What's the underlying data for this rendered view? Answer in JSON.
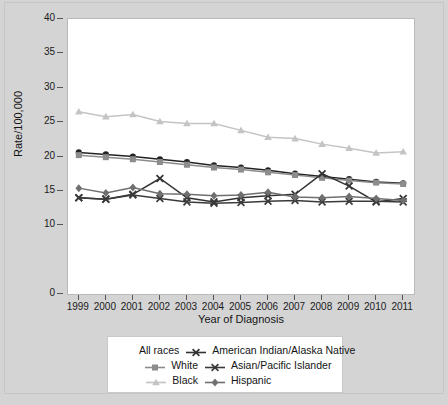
{
  "chart_data": {
    "type": "line",
    "title": "",
    "xlabel": "Year of Diagnosis",
    "ylabel": "Rate/100,000",
    "x": [
      1999,
      2000,
      2001,
      2002,
      2003,
      2004,
      2005,
      2006,
      2007,
      2008,
      2009,
      2010,
      2011
    ],
    "categories": [
      "1999",
      "2000",
      "2001",
      "2002",
      "2003",
      "2004",
      "2005",
      "2006",
      "2007",
      "2008",
      "2009",
      "2010",
      "2011"
    ],
    "xlim": [
      1998.6,
      2011.4
    ],
    "ylim": [
      0,
      40
    ],
    "y_ticks": [
      0,
      10,
      15,
      20,
      25,
      30,
      35,
      40
    ],
    "y_tick_labels": [
      "0",
      "10",
      "15",
      "20",
      "25",
      "30",
      "35",
      "40"
    ],
    "grid": false,
    "legend_position": "bottom",
    "series": [
      {
        "name": "All races",
        "marker": "circle",
        "color": "#232323",
        "values": [
          20.6,
          20.3,
          20.0,
          19.6,
          19.2,
          18.7,
          18.4,
          18.0,
          17.5,
          17.1,
          16.7,
          16.3,
          16.1
        ]
      },
      {
        "name": "White",
        "marker": "square",
        "color": "#8c8c8c",
        "values": [
          20.2,
          19.9,
          19.6,
          19.2,
          18.8,
          18.4,
          18.1,
          17.7,
          17.3,
          16.9,
          16.5,
          16.2,
          16.0
        ]
      },
      {
        "name": "Black",
        "marker": "triangle",
        "color": "#c4c4c4",
        "values": [
          26.5,
          25.8,
          26.1,
          25.1,
          24.8,
          24.8,
          23.8,
          22.8,
          22.6,
          21.8,
          21.2,
          20.5,
          20.7
        ]
      },
      {
        "name": "American Indian/Alaska Native",
        "marker": "cross",
        "color": "#333333",
        "values": [
          14.0,
          13.8,
          14.5,
          16.8,
          14.0,
          13.4,
          14.0,
          14.3,
          14.5,
          17.5,
          15.7,
          13.4,
          13.9
        ]
      },
      {
        "name": "Asian/Pacific Islander",
        "marker": "cross",
        "color": "#3a3a3a",
        "values": [
          14.0,
          13.8,
          14.4,
          13.9,
          13.4,
          13.2,
          13.3,
          13.5,
          13.6,
          13.4,
          13.5,
          13.5,
          13.4
        ]
      },
      {
        "name": "Hispanic",
        "marker": "diamond",
        "color": "#6f6f6f",
        "values": [
          15.4,
          14.7,
          15.5,
          14.6,
          14.5,
          14.3,
          14.4,
          14.8,
          14.1,
          14.0,
          14.2,
          13.9,
          13.6
        ]
      }
    ]
  },
  "axes": {
    "y_title": "Rate/100,000",
    "x_title": "Year of Diagnosis"
  },
  "legend": {
    "rows": [
      {
        "left": {
          "label": "All races",
          "marker": "none",
          "color": "#232323"
        },
        "right": {
          "label": "American Indian/Alaska Native",
          "marker": "cross",
          "color": "#333333"
        }
      },
      {
        "left": {
          "label": "White",
          "marker": "square",
          "color": "#8c8c8c"
        },
        "right": {
          "label": "Asian/Pacific Islander",
          "marker": "cross",
          "color": "#3a3a3a"
        }
      },
      {
        "left": {
          "label": "Black",
          "marker": "triangle",
          "color": "#c4c4c4"
        },
        "right": {
          "label": "Hispanic",
          "marker": "diamond",
          "color": "#6f6f6f"
        }
      }
    ]
  },
  "colors": {
    "figure_background": "#d4d4d4",
    "plot_background": "#ffffff",
    "axis": "#555555",
    "text": "#141414"
  }
}
